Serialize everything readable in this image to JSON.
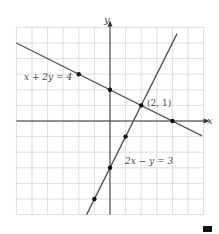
{
  "chart_data": {
    "type": "line",
    "title": "",
    "xlabel": "x",
    "ylabel": "y",
    "xlim": [
      -6,
      6
    ],
    "ylim": [
      -6,
      6
    ],
    "grid": true,
    "series": [
      {
        "name": "x + 2y = 4",
        "equation": "x + 2y = 4",
        "points": [
          [
            -2,
            3
          ],
          [
            0,
            2
          ],
          [
            4,
            0
          ]
        ]
      },
      {
        "name": "2x − y = 3",
        "equation": "2x − y = 3",
        "points": [
          [
            1,
            -1
          ],
          [
            0,
            -3
          ],
          [
            -1,
            -5
          ]
        ]
      }
    ],
    "annotations": [
      {
        "text": "(2, 1)",
        "x": 2,
        "y": 1
      }
    ]
  },
  "labels": {
    "x_axis": "x",
    "y_axis": "y",
    "line1": "x + 2y = 4",
    "line2": "2x − y = 3",
    "intersection": "(2, 1)"
  },
  "colors": {
    "grid": "#d6d6d6",
    "axis": "#333333",
    "line": "#555555",
    "point": "#111111"
  }
}
